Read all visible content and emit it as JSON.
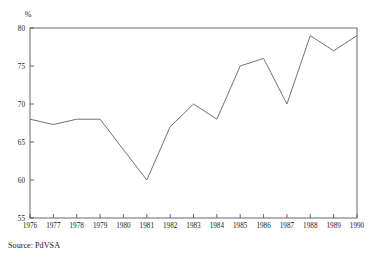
{
  "chart_data": {
    "type": "line",
    "title": "",
    "subtitle": "",
    "xlabel": "",
    "ylabel": "",
    "unit_label": "%",
    "x": [
      1976,
      1977,
      1978,
      1979,
      1980,
      1981,
      1982,
      1983,
      1984,
      1985,
      1986,
      1987,
      1988,
      1989,
      1990
    ],
    "xtick_labels": [
      "1976",
      "1977",
      "1978",
      "1979",
      "1980",
      "1981",
      "1982",
      "1983",
      "1984",
      "1985",
      "1986",
      "1987",
      "1988",
      "1989",
      "1990"
    ],
    "values": [
      68,
      67.3,
      68,
      68,
      64,
      60,
      67,
      70,
      68,
      75,
      76,
      70,
      79,
      77,
      79
    ],
    "ytick_labels": [
      "55",
      "60",
      "65",
      "70",
      "75",
      "80"
    ],
    "yticks": [
      55,
      60,
      65,
      70,
      75,
      80
    ],
    "ylim": [
      55,
      80
    ],
    "xlim": [
      1976,
      1990
    ],
    "grid": false,
    "legend": false,
    "legend_position": "none",
    "line_color": "#6a6a6c",
    "frame_color": "#58585a"
  },
  "figure": {
    "source_note": "Source: PdVSA"
  }
}
